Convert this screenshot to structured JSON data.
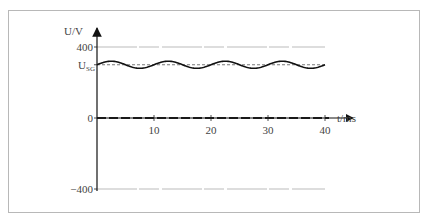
{
  "chart_data": {
    "type": "line",
    "title": "",
    "xlabel": "t/ms",
    "ylabel": "U/V",
    "xlim": [
      0,
      40
    ],
    "ylim": [
      -400,
      400
    ],
    "x_ticks": [
      10,
      20,
      30,
      40
    ],
    "y_ticks": [
      {
        "value": 400,
        "label": "400"
      },
      {
        "value": 300,
        "label": "U",
        "sub": "SG"
      },
      {
        "value": 0,
        "label": "0"
      },
      {
        "value": -400,
        "label": "-400"
      }
    ],
    "grid": false,
    "reference_lines": [
      {
        "name": "+400 V level",
        "y": 400,
        "style": "thin gray"
      },
      {
        "name": "-400 V level",
        "y": -400,
        "style": "thin gray"
      },
      {
        "name": "U_SG mean",
        "y": 300,
        "style": "dashed"
      },
      {
        "name": "zero line",
        "y": 0,
        "style": "dashed bold"
      }
    ],
    "series": [
      {
        "name": "output voltage",
        "description": "DC level U_SG (~300 V) with small sinusoidal ripple, period ~10 ms",
        "mean": 300,
        "ripple_amplitude": 20,
        "period_ms": 10,
        "x": [
          0,
          2.5,
          5,
          7.5,
          10,
          12.5,
          15,
          17.5,
          20,
          22.5,
          25,
          27.5,
          30,
          32.5,
          35,
          37.5,
          40
        ],
        "values": [
          300,
          320,
          300,
          280,
          300,
          320,
          300,
          280,
          300,
          320,
          300,
          280,
          300,
          320,
          300,
          280,
          300
        ]
      }
    ]
  }
}
